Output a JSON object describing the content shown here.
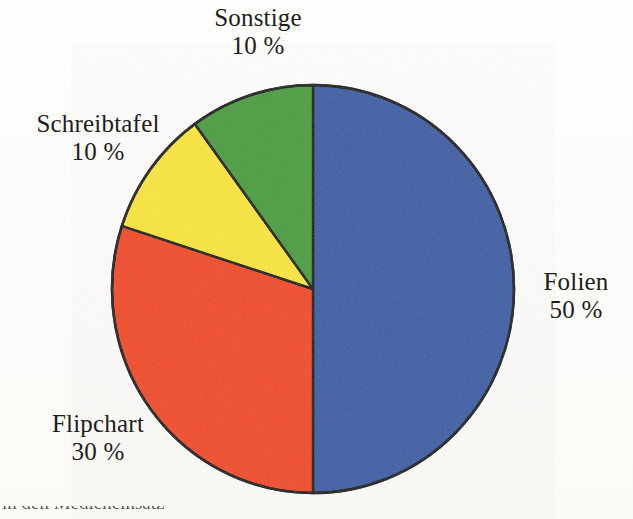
{
  "figure": {
    "type": "pie-chart",
    "background_color": "#fdfcfa",
    "outline_color": "#151515",
    "text_color": "#1d1d1b",
    "caption_partial": "in den Medieneinsatz"
  },
  "labels": {
    "sonstige": {
      "name": "Sonstige",
      "value": "10 %"
    },
    "schreibtafel": {
      "name": "Schreibtafel",
      "value": "10 %"
    },
    "flipchart": {
      "name": "Flipchart",
      "value": "30 %"
    },
    "folien": {
      "name": "Folien",
      "value": "50 %"
    }
  },
  "chart_data": {
    "type": "pie",
    "title": "",
    "categories": [
      "Folien",
      "Flipchart",
      "Schreibtafel",
      "Sonstige"
    ],
    "values": [
      50,
      30,
      10,
      10
    ],
    "value_labels": [
      "50 %",
      "30 %",
      "10 %",
      "10 %"
    ],
    "unit": "%",
    "total": 100,
    "colors": [
      "#3c5fa5",
      "#f04a20",
      "#f7e43a",
      "#4a9e3e"
    ],
    "start_angle_deg": 0,
    "direction": "clockwise",
    "slice_angles_deg": [
      180,
      108,
      36,
      36
    ],
    "legend": "labels-outside",
    "grid": false,
    "center": {
      "x": 313,
      "y": 289
    },
    "radius": {
      "x": 201,
      "y": 204
    },
    "slices": [
      {
        "label": "Folien",
        "value": 50,
        "value_label": "50 %",
        "color": "#3c5fa5",
        "start_deg": 0,
        "end_deg": 180
      },
      {
        "label": "Flipchart",
        "value": 30,
        "value_label": "30 %",
        "color": "#f04a20",
        "start_deg": 180,
        "end_deg": 288
      },
      {
        "label": "Schreibtafel",
        "value": 10,
        "value_label": "10 %",
        "color": "#f7e43a",
        "start_deg": 288,
        "end_deg": 324
      },
      {
        "label": "Sonstige",
        "value": 10,
        "value_label": "10 %",
        "color": "#4a9e3e",
        "start_deg": 324,
        "end_deg": 360
      }
    ]
  }
}
